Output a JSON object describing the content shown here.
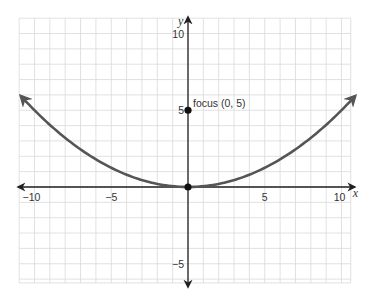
{
  "chart_data": {
    "type": "line",
    "title": "",
    "xlabel": "x",
    "ylabel": "y",
    "xlim": [
      -11,
      10.6
    ],
    "ylim": [
      -6.25,
      11
    ],
    "grid": true,
    "grid_step": 1,
    "x_ticks": [
      {
        "value": -10,
        "label": "−10"
      },
      {
        "value": -5,
        "label": "−5"
      },
      {
        "value": 5,
        "label": "5"
      },
      {
        "value": 10,
        "label": "10"
      }
    ],
    "y_ticks": [
      {
        "value": 10,
        "label": "10"
      },
      {
        "value": 5,
        "label": "5"
      },
      {
        "value": -5,
        "label": "−5"
      }
    ],
    "series": [
      {
        "name": "parabola",
        "equation": "y = x^2 / 20",
        "color": "#555555",
        "x": [
          -10.9,
          -10,
          -8,
          -6,
          -4,
          -2,
          0,
          2,
          4,
          6,
          8,
          10,
          10.9
        ],
        "y": [
          5.94,
          5,
          3.2,
          1.8,
          0.8,
          0.2,
          0,
          0.2,
          0.8,
          1.8,
          3.2,
          5,
          5.94
        ],
        "arrows": "both"
      }
    ],
    "points": [
      {
        "name": "focus",
        "x": 0,
        "y": 5,
        "label": "focus (0, 5)"
      },
      {
        "name": "vertex",
        "x": 0,
        "y": 0,
        "label": ""
      }
    ],
    "colors": {
      "axis": "#231f20",
      "grid": "#d9d9d9",
      "curve": "#555555",
      "point": "#111111"
    }
  }
}
